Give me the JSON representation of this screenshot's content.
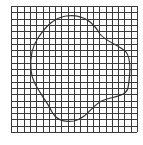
{
  "figure": {
    "background_color": "#ffffff",
    "grid": {
      "x": 11,
      "y": 6,
      "size": 126,
      "divisions": 20,
      "line_color": "#3a3a3a",
      "line_width": 1
    },
    "shape": {
      "type": "closed-curve",
      "stroke_color": "#333333",
      "stroke_width": 1.2,
      "fill": "none",
      "path": "M 66 16 C 80 14, 92 20, 100 34 C 106 42, 118 44, 126 52 C 132 60, 130 76, 128 88 C 126 96, 116 96, 104 100 C 92 104, 88 118, 74 121 C 62 123, 54 118, 50 108 C 42 94, 32 84, 31 70 C 30 58, 31 48, 38 38 C 46 26, 54 18, 66 16 Z"
    }
  }
}
